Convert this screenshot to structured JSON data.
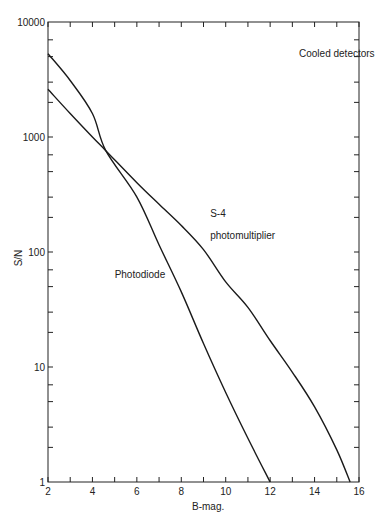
{
  "chart_data": {
    "type": "line",
    "title": "",
    "xlabel": "B-mag.",
    "ylabel": "S/N",
    "xscale": "linear",
    "yscale": "log",
    "xlim": [
      2,
      16
    ],
    "ylim": [
      1,
      10000
    ],
    "x_ticks": [
      2,
      4,
      6,
      8,
      10,
      12,
      14,
      16
    ],
    "x_minor_ticks": [
      3,
      5,
      7,
      9,
      11,
      13,
      15
    ],
    "y_ticks": [
      1,
      10,
      100,
      1000,
      10000
    ],
    "y_tick_labels": [
      "1",
      "10",
      "100",
      "1000",
      "10000"
    ],
    "grid": false,
    "annotations": [
      {
        "text": "Cooled detectors",
        "x": 13.3,
        "y": 5000
      },
      {
        "text": "S-4",
        "x": 9.3,
        "y": 200
      },
      {
        "text": "photomultiplier",
        "x": 9.3,
        "y": 130
      },
      {
        "text": "Photodiode",
        "x": 5.0,
        "y": 60
      }
    ],
    "series": [
      {
        "name": "Photodiode",
        "x": [
          2,
          3,
          4,
          4.6,
          6,
          7,
          8,
          9,
          10,
          11,
          12
        ],
        "values": [
          5300,
          3100,
          1600,
          760,
          300,
          115,
          45,
          16,
          6,
          2.4,
          1
        ]
      },
      {
        "name": "S-4 photomultiplier",
        "x": [
          2,
          3,
          4,
          4.6,
          6,
          7,
          8,
          9,
          10,
          11,
          12,
          13,
          14,
          15,
          15.6
        ],
        "values": [
          2600,
          1600,
          1000,
          760,
          400,
          260,
          170,
          105,
          55,
          33,
          17,
          9,
          4.5,
          1.9,
          1
        ]
      }
    ]
  }
}
